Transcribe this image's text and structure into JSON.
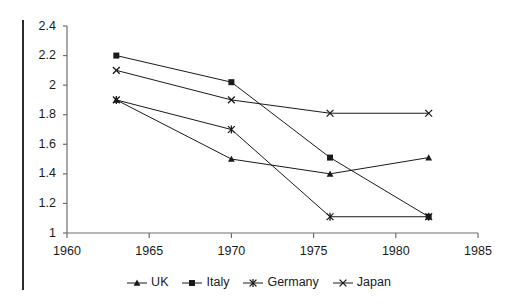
{
  "chart_data": {
    "type": "line",
    "title": "",
    "xlabel": "",
    "ylabel": "",
    "xlim": [
      1960,
      1985
    ],
    "ylim": [
      1,
      2.4
    ],
    "xticks": [
      1960,
      1965,
      1970,
      1975,
      1980,
      1985
    ],
    "yticks": [
      "1",
      "1.2",
      "1.4",
      "1.6",
      "1.8",
      "2",
      "2.2",
      "2.4"
    ],
    "ytick_values": [
      1,
      1.2,
      1.4,
      1.6,
      1.8,
      2.0,
      2.2,
      2.4
    ],
    "grid": false,
    "legend_position": "bottom",
    "series": [
      {
        "name": "UK",
        "marker": "triangle",
        "color": "#1a1a1a",
        "x": [
          1963,
          1970,
          1976,
          1982
        ],
        "values": [
          1.9,
          1.5,
          1.4,
          1.51
        ]
      },
      {
        "name": "Italy",
        "marker": "square",
        "color": "#1a1a1a",
        "x": [
          1963,
          1970,
          1976,
          1982
        ],
        "values": [
          2.2,
          2.02,
          1.51,
          1.11
        ]
      },
      {
        "name": "Germany",
        "marker": "star",
        "color": "#1a1a1a",
        "x": [
          1963,
          1970,
          1976,
          1982
        ],
        "values": [
          1.9,
          1.7,
          1.11,
          1.11
        ]
      },
      {
        "name": "Japan",
        "marker": "x",
        "color": "#1a1a1a",
        "x": [
          1963,
          1970,
          1976,
          1982
        ],
        "values": [
          2.1,
          1.9,
          1.81,
          1.81
        ]
      }
    ]
  },
  "legend": {
    "entries": [
      {
        "label": "UK"
      },
      {
        "label": "Italy"
      },
      {
        "label": "Germany"
      },
      {
        "label": "Japan"
      }
    ]
  },
  "axes": {
    "x_labels": [
      "1960",
      "1965",
      "1970",
      "1975",
      "1980",
      "1985"
    ],
    "y_labels": [
      "2.4",
      "2.2",
      "2",
      "1.8",
      "1.6",
      "1.4",
      "1.2",
      "1"
    ]
  },
  "colors": {
    "ink": "#1a1a1a",
    "axis": "#6e6e6e",
    "background": "#ffffff"
  }
}
